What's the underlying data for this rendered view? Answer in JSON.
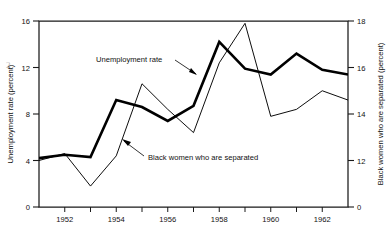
{
  "figure": {
    "scan_artifact": "2"
  },
  "axes": {
    "left": {
      "title": "Unemployment rate (percent)",
      "ticks": [
        "0",
        "4",
        "8",
        "12",
        "16"
      ],
      "values": [
        0,
        4,
        8,
        12,
        16
      ],
      "min": 0,
      "max": 16
    },
    "right": {
      "title": "Black women who are separated (percent)",
      "ticks": [
        "0",
        "12",
        "14",
        "16",
        "18"
      ],
      "values": [
        0,
        12,
        14,
        16,
        18
      ],
      "min": 10,
      "max": 18
    },
    "bottom": {
      "ticks": [
        "1952",
        "1954",
        "1956",
        "1958",
        "1960",
        "1962"
      ],
      "values": [
        1952,
        1954,
        1956,
        1958,
        1960,
        1962
      ],
      "min": 1951,
      "max": 1963
    }
  },
  "annotations": [
    {
      "name": "unemployment-rate",
      "text": "Unemployment rate"
    },
    {
      "name": "black-women-separated",
      "text": "Black women who are separated"
    }
  ],
  "chart_data": {
    "type": "line",
    "title": "",
    "xlabel": "",
    "ylabel": "Unemployment rate (percent)",
    "y2label": "Black women who are separated (percent)",
    "xlim": [
      1951,
      1963
    ],
    "ylim": [
      0,
      16
    ],
    "y2lim": [
      10,
      18
    ],
    "grid": false,
    "legend": "annotations-inline",
    "x": [
      1951,
      1952,
      1953,
      1954,
      1955,
      1956,
      1957,
      1958,
      1959,
      1960,
      1961,
      1962,
      1963
    ],
    "series": [
      {
        "name": "Unemployment rate",
        "axis": "left",
        "style": "thick",
        "units": "percent",
        "values": [
          4.2,
          4.5,
          4.3,
          9.2,
          8.6,
          7.4,
          8.7,
          14.2,
          11.9,
          11.4,
          13.2,
          11.8,
          11.4
        ]
      },
      {
        "name": "Black women who are separated",
        "axis": "right",
        "style": "thin",
        "units": "percent",
        "values": [
          12.0,
          12.3,
          10.9,
          12.2,
          15.3,
          14.2,
          13.2,
          16.2,
          17.9,
          13.9,
          14.2,
          15.0,
          14.6
        ]
      }
    ]
  }
}
